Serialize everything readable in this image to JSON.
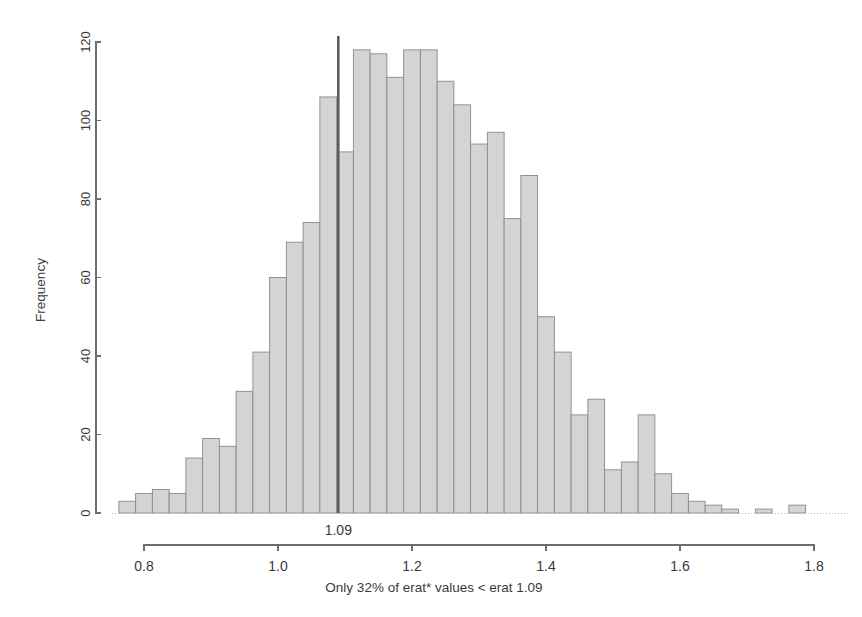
{
  "chart_data": {
    "type": "bar",
    "title": "",
    "subtitle": "",
    "xlabel": "Only 32% of erat* values < erat 1.09",
    "ylabel": "Frequency",
    "xlim": [
      0.7625,
      1.7875
    ],
    "ylim": [
      0,
      120
    ],
    "grid": false,
    "legend": null,
    "bin_width": 0.025,
    "x_ticks": [
      "0.8",
      "1.0",
      "1.2",
      "1.4",
      "1.6",
      "1.8"
    ],
    "x_tick_values": [
      0.8,
      1.0,
      1.2,
      1.4,
      1.6,
      1.8
    ],
    "y_ticks": [
      "0",
      "20",
      "40",
      "60",
      "80",
      "100",
      "120"
    ],
    "y_tick_values": [
      0,
      20,
      40,
      60,
      80,
      100,
      120
    ],
    "annotations": [
      {
        "name": "reference-line",
        "label": "1.09",
        "x_value": 1.09,
        "orientation": "vertical",
        "color": "#5d5d5d"
      }
    ],
    "bar_color": "#d4d4d4",
    "bar_edge_color": "#8a8a8a",
    "bin_starts": [
      0.7625,
      0.7875,
      0.8125,
      0.8375,
      0.8625,
      0.8875,
      0.9125,
      0.9375,
      0.9625,
      0.9875,
      1.0125,
      1.0375,
      1.0625,
      1.0875,
      1.1125,
      1.1375,
      1.1625,
      1.1875,
      1.2125,
      1.2375,
      1.2625,
      1.2875,
      1.3125,
      1.3375,
      1.3625,
      1.3875,
      1.4125,
      1.4375,
      1.4625,
      1.4875,
      1.5125,
      1.5375,
      1.5625,
      1.5875,
      1.6125,
      1.6375,
      1.6625,
      1.6875,
      1.7125,
      1.7375,
      1.7625
    ],
    "categories": [
      "0.7625",
      "0.7875",
      "0.8125",
      "0.8375",
      "0.8625",
      "0.8875",
      "0.9125",
      "0.9375",
      "0.9625",
      "0.9875",
      "1.0125",
      "1.0375",
      "1.0625",
      "1.0875",
      "1.1125",
      "1.1375",
      "1.1625",
      "1.1875",
      "1.2125",
      "1.2375",
      "1.2625",
      "1.2875",
      "1.3125",
      "1.3375",
      "1.3625",
      "1.3875",
      "1.4125",
      "1.4375",
      "1.4625",
      "1.4875",
      "1.5125",
      "1.5375",
      "1.5625",
      "1.5875",
      "1.6125",
      "1.6375",
      "1.6625",
      "1.6875",
      "1.7125",
      "1.7375",
      "1.7625"
    ],
    "values": [
      3,
      5,
      6,
      5,
      14,
      19,
      17,
      31,
      41,
      60,
      69,
      74,
      106,
      92,
      118,
      117,
      111,
      118,
      118,
      110,
      104,
      94,
      97,
      75,
      86,
      50,
      41,
      25,
      29,
      11,
      13,
      25,
      10,
      5,
      3,
      2,
      1,
      0,
      1,
      0,
      2
    ]
  },
  "axis": {
    "y_title": "Frequency",
    "x_title": "Only 32% of erat* values < erat 1.09",
    "marker_text": "1.09"
  }
}
